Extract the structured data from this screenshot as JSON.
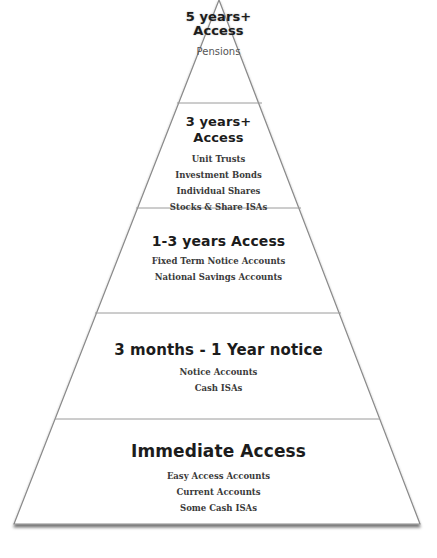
{
  "diagram": {
    "type": "pyramid",
    "colors": {
      "outline": "#8a8a8a",
      "fill": "#ffffff",
      "text": "#1c1c1c",
      "shadow": "#9a9a9a"
    },
    "tiers": [
      {
        "title_line1": "5 years+",
        "title_line2": "Access",
        "items": [
          "Pensions"
        ]
      },
      {
        "title_line1": "3 years+",
        "title_line2": "Access",
        "items": [
          "Unit Trusts",
          "Investment Bonds",
          "Individual Shares",
          "Stocks & Share ISAs"
        ]
      },
      {
        "title_line1": "1-3 years Access",
        "items": [
          "Fixed Term Notice Accounts",
          "National Savings Accounts"
        ]
      },
      {
        "title_line1": "3 months - 1 Year notice",
        "items": [
          "Notice Accounts",
          "Cash ISAs"
        ]
      },
      {
        "title_line1": "Immediate Access",
        "items": [
          "Easy Access Accounts",
          "Current Accounts",
          "Some Cash ISAs"
        ]
      }
    ]
  }
}
